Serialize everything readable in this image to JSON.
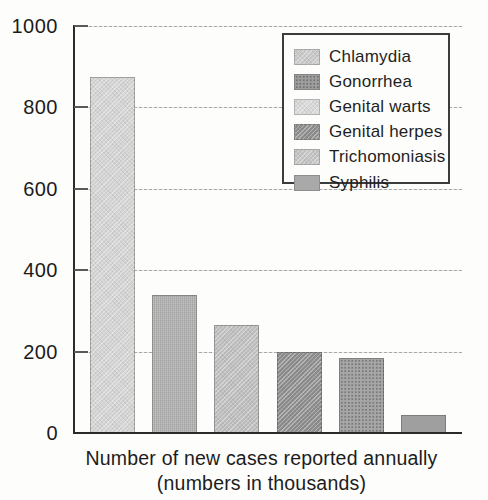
{
  "figure": {
    "caption_line1": "Number of new cases reported annually",
    "caption_line2": "(numbers in thousands)"
  },
  "chart_data": {
    "type": "bar",
    "categories": [
      "Chlamydia",
      "Gonorrhea",
      "Genital warts",
      "Genital herpes",
      "Trichomoniasis",
      "Syphilis"
    ],
    "values": [
      875,
      340,
      265,
      200,
      185,
      45
    ],
    "title": "",
    "xlabel": "Number of new cases reported annually (numbers in thousands)",
    "ylabel": "",
    "ylim": [
      0,
      1000
    ],
    "yticks": [
      0,
      200,
      400,
      600,
      800,
      1000
    ],
    "grid": "horizontal dashed gray lines every 200 units",
    "legend_position": "top-right",
    "legend_entries": [
      "Chlamydia",
      "Gonorrhea",
      "Genital warts",
      "Genital herpes",
      "Trichomoniasis",
      "Syphilis"
    ],
    "bar_styles": [
      {
        "base": "#d4d4d4",
        "pattern": "diagonal"
      },
      {
        "base": "#b0b0b0",
        "pattern": "check"
      },
      {
        "base": "#bfbfbf",
        "pattern": "diagonal"
      },
      {
        "base": "#8e8e8e",
        "pattern": "diagonal"
      },
      {
        "base": "#a6a6a6",
        "pattern": "dots"
      },
      {
        "base": "#9f9f9f",
        "pattern": "solid"
      }
    ],
    "legend_swatch_styles": [
      {
        "base": "#c9c9c9",
        "pattern": "diagonal"
      },
      {
        "base": "#9e9e9e",
        "pattern": "dots"
      },
      {
        "base": "#d8d8d8",
        "pattern": "diagonal"
      },
      {
        "base": "#8e8e8e",
        "pattern": "diagonal"
      },
      {
        "base": "#c4c4c4",
        "pattern": "diagonal"
      },
      {
        "base": "#a9a9a9",
        "pattern": "solid"
      }
    ],
    "colors": {
      "paper": "#fdfdfb",
      "axis": "#2b2b2b",
      "grid": "#a8a8a8",
      "text": "#1e1e1e"
    }
  }
}
